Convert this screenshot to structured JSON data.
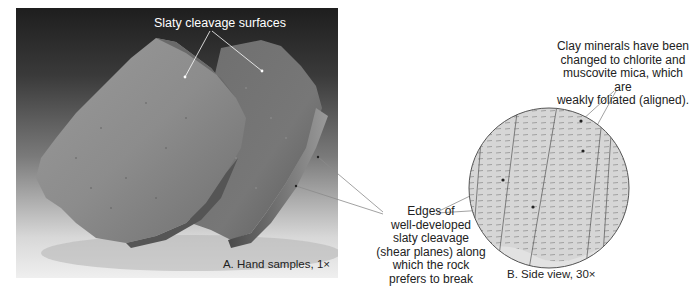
{
  "figure": {
    "panel_a": {
      "top_label": "Slaty cleavage surfaces",
      "caption": "A. Hand samples, 1×"
    },
    "middle_callout": {
      "lines": [
        "Edges of",
        "well-developed",
        "slaty cleavage",
        "(shear planes) along",
        "which the rock",
        "prefers to break"
      ]
    },
    "panel_b": {
      "callout_lines": [
        "Clay minerals have been",
        "changed to chlorite and",
        "muscovite mica, which are",
        "weakly foliated (aligned)."
      ],
      "caption": "B. Side view, 30×"
    }
  },
  "colors": {
    "leader_line": "#8a8a8a",
    "circle_fill": "#d6d6d6",
    "circle_stroke": "#555555",
    "text": "#222222"
  }
}
